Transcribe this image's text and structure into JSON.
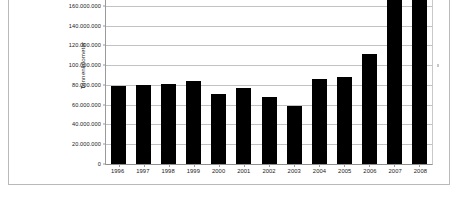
{
  "chart_data": {
    "type": "bar",
    "title": "",
    "xlabel": "",
    "ylabel": "Tonnenkilometer",
    "categories": [
      "1996",
      "1997",
      "1998",
      "1999",
      "2000",
      "2001",
      "2002",
      "2003",
      "2004",
      "2005",
      "2006",
      "2007",
      "2008"
    ],
    "values": [
      78500000,
      79500000,
      80500000,
      83500000,
      70500000,
      76000000,
      67500000,
      58000000,
      85000000,
      87000000,
      110500000,
      178000000,
      178000000
    ],
    "series": [
      {
        "name": "Tonnenkilometer",
        "values": [
          78500000,
          79500000,
          80500000,
          83500000,
          70500000,
          76000000,
          67500000,
          58000000,
          85000000,
          87000000,
          110500000,
          178000000,
          178000000
        ]
      }
    ],
    "ytick_labels": [
      "0",
      "20.000.000",
      "40.000.000",
      "60.000.000",
      "80.000.000",
      "100.000.000",
      "120.000.000",
      "140.000.000",
      "160.000.000"
    ],
    "ytick_values": [
      0,
      20000000,
      40000000,
      60000000,
      80000000,
      100000000,
      120000000,
      140000000,
      160000000
    ],
    "ylim": [
      0,
      180000000
    ],
    "grid": true,
    "legend": false,
    "legend_position": "none",
    "bar_color": "#000000",
    "grid_color": "#c2c2c2",
    "axis_color": "#9a9a9a",
    "note": "Bars for 2007 and 2008 are clipped by the top edge of the screenshot."
  },
  "colors": {
    "background": "#ffffff",
    "frame": "#b9b9b9",
    "text": "#1a1a1a"
  }
}
